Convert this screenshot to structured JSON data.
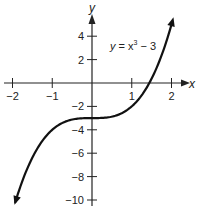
{
  "chart_data": {
    "type": "line",
    "title": "",
    "function": "y = x^3 - 3",
    "annotation": {
      "text_y": "y",
      "text_eq": " = x",
      "text_exp": "3",
      "text_tail": " − 3"
    },
    "xlabel": "x",
    "ylabel": "y",
    "xlim": [
      -2,
      2
    ],
    "ylim": [
      -10,
      4
    ],
    "x_ticks": [
      {
        "value": -2,
        "label": "−2"
      },
      {
        "value": -1,
        "label": "−1"
      },
      {
        "value": 1,
        "label": "1"
      },
      {
        "value": 2,
        "label": "2"
      }
    ],
    "y_ticks": [
      {
        "value": 4,
        "label": "4"
      },
      {
        "value": 2,
        "label": "2"
      },
      {
        "value": -2,
        "label": "−2"
      },
      {
        "value": -4,
        "label": "−4"
      },
      {
        "value": -6,
        "label": "−6"
      },
      {
        "value": -8,
        "label": "−8"
      },
      {
        "value": -10,
        "label": "−10"
      }
    ],
    "series": [
      {
        "name": "y = x^3 - 3",
        "x": [
          -1.93,
          -1.5,
          -1.0,
          -0.5,
          0,
          0.5,
          1.0,
          1.44,
          1.8,
          2.05
        ],
        "y": [
          -10.2,
          -6.38,
          -4.0,
          -3.13,
          -3.0,
          -2.88,
          -2.0,
          0.0,
          2.83,
          5.6
        ]
      }
    ],
    "grid": false,
    "legend": "none"
  },
  "colors": {
    "axis": "#222222",
    "curve": "#111111",
    "text": "#222222"
  }
}
